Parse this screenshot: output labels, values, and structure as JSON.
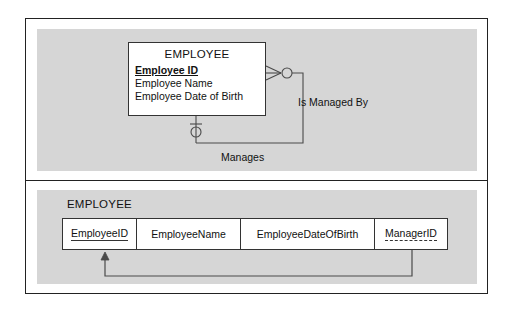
{
  "figure": {
    "background": "#ffffff",
    "panel_fill": "#d6d6d6",
    "line_color": "#333333",
    "frame_color": "#222222"
  },
  "er_panel": {
    "entity": {
      "title": "EMPLOYEE",
      "attributes": [
        {
          "label": "Employee ID",
          "key": "primary"
        },
        {
          "label": "Employee Name",
          "key": "none"
        },
        {
          "label": "Employee Date of Birth",
          "key": "none"
        }
      ]
    },
    "relationships": [
      {
        "label": "Is Managed By",
        "from_cardinality": "zero-or-many",
        "notation": "crows-foot-with-circle"
      },
      {
        "label": "Manages",
        "from_cardinality": "zero-or-one",
        "notation": "circle-and-tick"
      }
    ]
  },
  "relational_panel": {
    "table_name": "EMPLOYEE",
    "columns": [
      {
        "name": "EmployeeID",
        "key": "primary"
      },
      {
        "name": "EmployeeName",
        "key": "none"
      },
      {
        "name": "EmployeeDateOfBirth",
        "key": "none"
      },
      {
        "name": "ManagerID",
        "key": "foreign"
      }
    ],
    "foreign_key_reference": {
      "from_column": "ManagerID",
      "to_column": "EmployeeID"
    }
  }
}
